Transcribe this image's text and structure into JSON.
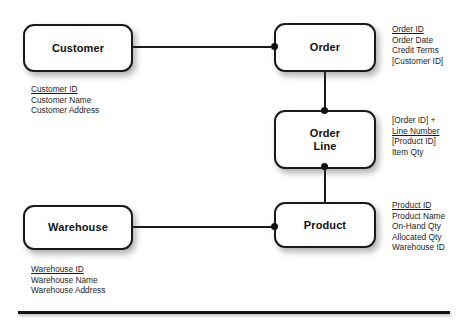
{
  "diagram": {
    "entities": [
      {
        "id": "customer",
        "label": "Customer",
        "attributes": [
          {
            "text": "Customer ID",
            "key": true
          },
          {
            "text": "Customer Name",
            "key": false
          },
          {
            "text": "Customer Address",
            "key": false
          }
        ]
      },
      {
        "id": "order",
        "label": "Order",
        "attributes": [
          {
            "text": "Order ID",
            "key": true
          },
          {
            "text": "Order Date",
            "key": false
          },
          {
            "text": "Credit Terms",
            "key": false
          },
          {
            "text": "[Customer ID]",
            "key": false
          }
        ]
      },
      {
        "id": "order-line",
        "label": "Order\nLine",
        "attributes": [
          {
            "text": "[Order ID] +",
            "key": false
          },
          {
            "text": "Line Number",
            "key": true
          },
          {
            "text": "[Product ID]",
            "key": false
          },
          {
            "text": "Item Qty",
            "key": false
          }
        ]
      },
      {
        "id": "product",
        "label": "Product",
        "attributes": [
          {
            "text": "Product ID",
            "key": true
          },
          {
            "text": "Product Name",
            "key": false
          },
          {
            "text": "On-Hand Qty",
            "key": false
          },
          {
            "text": "Allocated Qty",
            "key": false
          },
          {
            "text": "Warehouse ID",
            "key": false
          }
        ]
      },
      {
        "id": "warehouse",
        "label": "Warehouse",
        "attributes": [
          {
            "text": "Warehouse ID",
            "key": true
          },
          {
            "text": "Warehouse Name",
            "key": false
          },
          {
            "text": "Warehouse Address",
            "key": false
          }
        ]
      }
    ],
    "relationships": [
      {
        "id": "customer-order",
        "from": "customer",
        "to": "order"
      },
      {
        "id": "order-orderline",
        "from": "order",
        "to": "order-line"
      },
      {
        "id": "orderline-product",
        "from": "order-line",
        "to": "product"
      },
      {
        "id": "warehouse-product",
        "from": "warehouse",
        "to": "product"
      }
    ],
    "colors": {
      "stroke": "#1a1a1a",
      "text": "#1d1d1d",
      "background": "#ffffff"
    }
  }
}
